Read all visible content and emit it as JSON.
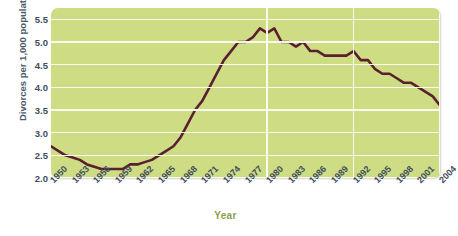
{
  "chart_data": {
    "type": "line",
    "title": "",
    "xlabel": "Year",
    "ylabel": "Divorces per 1,000 population",
    "ylim": [
      2.0,
      5.75
    ],
    "xlim": [
      1950,
      2004
    ],
    "grid": "horizontal gridlines at every 0.5; vertical gridlines at 1980, 1992, 2004",
    "legend": "none",
    "line_color": "#5a2030",
    "plot_background": "#cedd84",
    "gridline_color": "#fdfdf4",
    "ytick_labels": [
      "2.0",
      "2.5",
      "3.0",
      "3.5",
      "4.0",
      "4.5",
      "5.0",
      "5.5"
    ],
    "ytick_values": [
      2.0,
      2.5,
      3.0,
      3.5,
      4.0,
      4.5,
      5.0,
      5.5
    ],
    "xtick_labels": [
      "1950",
      "1953",
      "1956",
      "1959",
      "1962",
      "1965",
      "1968",
      "1971",
      "1974",
      "1977",
      "1980",
      "1983",
      "1986",
      "1989",
      "1992",
      "1995",
      "1998",
      "2001",
      "2004"
    ],
    "xtick_values": [
      1950,
      1953,
      1956,
      1959,
      1962,
      1965,
      1968,
      1971,
      1974,
      1977,
      1980,
      1983,
      1986,
      1989,
      1992,
      1995,
      1998,
      2001,
      2004
    ],
    "x": [
      1950,
      1951,
      1952,
      1953,
      1954,
      1955,
      1956,
      1957,
      1958,
      1959,
      1960,
      1961,
      1962,
      1963,
      1964,
      1965,
      1966,
      1967,
      1968,
      1969,
      1970,
      1971,
      1972,
      1973,
      1974,
      1975,
      1976,
      1977,
      1978,
      1979,
      1980,
      1981,
      1982,
      1983,
      1984,
      1985,
      1986,
      1987,
      1988,
      1989,
      1990,
      1991,
      1992,
      1993,
      1994,
      1995,
      1996,
      1997,
      1998,
      1999,
      2000,
      2001,
      2002,
      2003,
      2004
    ],
    "values": [
      2.7,
      2.6,
      2.5,
      2.45,
      2.4,
      2.3,
      2.25,
      2.2,
      2.2,
      2.2,
      2.2,
      2.3,
      2.3,
      2.35,
      2.4,
      2.5,
      2.6,
      2.7,
      2.9,
      3.2,
      3.5,
      3.7,
      4.0,
      4.3,
      4.6,
      4.8,
      5.0,
      5.0,
      5.1,
      5.3,
      5.2,
      5.3,
      5.0,
      5.0,
      4.9,
      5.0,
      4.8,
      4.8,
      4.7,
      4.7,
      4.7,
      4.7,
      4.8,
      4.6,
      4.6,
      4.4,
      4.3,
      4.3,
      4.2,
      4.1,
      4.1,
      4.0,
      3.9,
      3.8,
      3.6
    ],
    "source_note": ""
  }
}
